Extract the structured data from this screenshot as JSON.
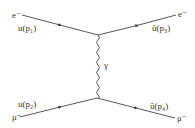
{
  "diagram": {
    "type": "feynman",
    "process": "electron-muon scattering via photon exchange (t-channel)",
    "colors": {
      "line": "#444444",
      "text": "#333333",
      "background": "#ffffff"
    },
    "particles": {
      "incoming_top": "e⁻",
      "outgoing_top": "e⁻",
      "incoming_bottom": "μ⁻",
      "outgoing_bottom": "μ⁻",
      "propagator": "γ"
    },
    "spinors": {
      "p1": "u(p₁)",
      "p2": "u(p₂)",
      "p3": "ū(p₃)",
      "p4": "ū(p₄)"
    }
  }
}
